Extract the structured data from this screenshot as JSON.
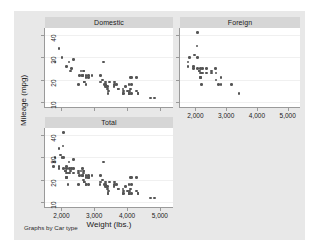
{
  "figure": {
    "note": "Graphs by Car type",
    "xlabel": "Weight (lbs.)",
    "ylabel": "Mileage (mpg)",
    "background": "#e8e8e8",
    "panel_header_color": "#d6d6d6",
    "marker_color": "#555555"
  },
  "chart_data": {
    "type": "scatter",
    "title": "",
    "subtitle": "",
    "xlabel": "Weight (lbs.)",
    "ylabel": "Mileage (mpg)",
    "xlim": [
      1500,
      5400
    ],
    "ylim": [
      8,
      43
    ],
    "xticks": [
      2000,
      3000,
      4000,
      5000
    ],
    "xtick_labels": [
      "2,000",
      "3,000",
      "4,000",
      "5,000"
    ],
    "yticks": [
      10,
      20,
      30,
      40
    ],
    "ytick_labels": [
      "10",
      "20",
      "30",
      "40"
    ],
    "grid": "horizontal",
    "legend": "none",
    "note": "Graphs by Car type",
    "panels": [
      {
        "label": "Domestic",
        "position": "top-left",
        "show_xticks": false,
        "points": [
          [
            2930,
            22
          ],
          [
            3350,
            17
          ],
          [
            2640,
            22
          ],
          [
            3250,
            20
          ],
          [
            4080,
            15
          ],
          [
            3670,
            18
          ],
          [
            3880,
            14
          ],
          [
            3400,
            16
          ],
          [
            4330,
            14
          ],
          [
            3900,
            14
          ],
          [
            4290,
            21
          ],
          [
            4100,
            21
          ],
          [
            3360,
            18
          ],
          [
            2160,
            26
          ],
          [
            2670,
            24
          ],
          [
            2595,
            24
          ],
          [
            2700,
            19
          ],
          [
            3310,
            18
          ],
          [
            2750,
            21
          ],
          [
            3470,
            19
          ],
          [
            4130,
            18
          ],
          [
            3620,
            19
          ],
          [
            2830,
            21
          ],
          [
            3200,
            22
          ],
          [
            4060,
            18
          ],
          [
            3720,
            16
          ],
          [
            3370,
            17
          ],
          [
            3740,
            16
          ],
          [
            3955,
            17
          ],
          [
            4010,
            15
          ],
          [
            3600,
            17
          ],
          [
            3330,
            18
          ],
          [
            2830,
            22
          ],
          [
            2560,
            22
          ],
          [
            4720,
            12
          ],
          [
            3430,
            15
          ],
          [
            3610,
            18
          ],
          [
            2690,
            24
          ],
          [
            3180,
            19
          ],
          [
            3280,
            28
          ],
          [
            2750,
            18
          ],
          [
            4060,
            14
          ],
          [
            4130,
            14
          ],
          [
            4060,
            14
          ],
          [
            4130,
            21
          ],
          [
            2690,
            19
          ],
          [
            2230,
            28
          ],
          [
            2370,
            29
          ],
          [
            2020,
            30
          ],
          [
            2280,
            24
          ],
          [
            2750,
            22
          ],
          [
            1800,
            28
          ],
          [
            1930,
            34
          ],
          [
            2520,
            18
          ],
          [
            2690,
            19
          ],
          [
            3420,
            14
          ],
          [
            3210,
            19
          ],
          [
            4070,
            14
          ],
          [
            4840,
            12
          ],
          [
            2640,
            22
          ],
          [
            3880,
            16
          ],
          [
            3400,
            17
          ],
          [
            4330,
            14
          ],
          [
            3900,
            15
          ],
          [
            4290,
            15
          ],
          [
            4100,
            16
          ],
          [
            3360,
            17
          ],
          [
            2300,
            25
          ],
          [
            3350,
            19
          ]
        ]
      },
      {
        "label": "Foreign",
        "position": "top-right",
        "show_xticks": true,
        "points": [
          [
            2520,
            23
          ],
          [
            2070,
            25
          ],
          [
            1800,
            30
          ],
          [
            1760,
            28
          ],
          [
            2050,
            35
          ],
          [
            2240,
            25
          ],
          [
            2520,
            24
          ],
          [
            2160,
            21
          ],
          [
            2370,
            25
          ],
          [
            2200,
            18
          ],
          [
            2670,
            20
          ],
          [
            2130,
            24
          ],
          [
            2650,
            25
          ],
          [
            2750,
            18
          ],
          [
            2160,
            21
          ],
          [
            1980,
            31
          ],
          [
            2830,
            18
          ],
          [
            2070,
            41
          ],
          [
            1930,
            25
          ],
          [
            2160,
            25
          ],
          [
            2370,
            23
          ],
          [
            3170,
            18
          ],
          [
            3420,
            14
          ],
          [
            2830,
            21
          ],
          [
            2200,
            23
          ],
          [
            2670,
            23
          ],
          [
            1760,
            26
          ],
          [
            1930,
            26
          ],
          [
            2070,
            30
          ],
          [
            2120,
            24
          ],
          [
            2160,
            23
          ],
          [
            2240,
            23
          ]
        ]
      },
      {
        "label": "Total",
        "position": "bottom-left",
        "show_xticks": true,
        "points": [
          [
            2930,
            22
          ],
          [
            3350,
            17
          ],
          [
            2640,
            22
          ],
          [
            3250,
            20
          ],
          [
            4080,
            15
          ],
          [
            3670,
            18
          ],
          [
            3880,
            14
          ],
          [
            3400,
            16
          ],
          [
            4330,
            14
          ],
          [
            3900,
            14
          ],
          [
            4290,
            21
          ],
          [
            4100,
            21
          ],
          [
            3360,
            18
          ],
          [
            2160,
            26
          ],
          [
            2670,
            24
          ],
          [
            2595,
            24
          ],
          [
            2700,
            19
          ],
          [
            3310,
            18
          ],
          [
            2750,
            21
          ],
          [
            3470,
            19
          ],
          [
            4130,
            18
          ],
          [
            3620,
            19
          ],
          [
            2830,
            21
          ],
          [
            3200,
            22
          ],
          [
            4060,
            18
          ],
          [
            3720,
            16
          ],
          [
            3370,
            17
          ],
          [
            3740,
            16
          ],
          [
            3955,
            17
          ],
          [
            4010,
            15
          ],
          [
            3600,
            17
          ],
          [
            3330,
            18
          ],
          [
            2830,
            22
          ],
          [
            2560,
            22
          ],
          [
            4720,
            12
          ],
          [
            3430,
            15
          ],
          [
            3610,
            18
          ],
          [
            2690,
            24
          ],
          [
            3180,
            19
          ],
          [
            3280,
            28
          ],
          [
            2750,
            18
          ],
          [
            4060,
            14
          ],
          [
            4130,
            14
          ],
          [
            4060,
            14
          ],
          [
            4130,
            21
          ],
          [
            2690,
            19
          ],
          [
            2230,
            28
          ],
          [
            2370,
            29
          ],
          [
            2020,
            30
          ],
          [
            2280,
            24
          ],
          [
            2750,
            22
          ],
          [
            1800,
            28
          ],
          [
            1930,
            34
          ],
          [
            2520,
            18
          ],
          [
            2690,
            19
          ],
          [
            3420,
            14
          ],
          [
            3210,
            19
          ],
          [
            4070,
            14
          ],
          [
            4840,
            12
          ],
          [
            2640,
            22
          ],
          [
            3880,
            16
          ],
          [
            3400,
            17
          ],
          [
            4330,
            14
          ],
          [
            3900,
            15
          ],
          [
            4290,
            15
          ],
          [
            4100,
            16
          ],
          [
            3360,
            17
          ],
          [
            2300,
            25
          ],
          [
            3350,
            19
          ],
          [
            2520,
            23
          ],
          [
            2070,
            25
          ],
          [
            1800,
            30
          ],
          [
            1760,
            28
          ],
          [
            2050,
            35
          ],
          [
            2240,
            25
          ],
          [
            2520,
            24
          ],
          [
            2160,
            21
          ],
          [
            2370,
            25
          ],
          [
            2200,
            18
          ],
          [
            2670,
            20
          ],
          [
            2130,
            24
          ],
          [
            2650,
            25
          ],
          [
            2750,
            18
          ],
          [
            2160,
            21
          ],
          [
            1980,
            31
          ],
          [
            2830,
            18
          ],
          [
            2070,
            41
          ],
          [
            1930,
            25
          ],
          [
            2160,
            25
          ],
          [
            2370,
            23
          ],
          [
            3170,
            18
          ],
          [
            3420,
            14
          ],
          [
            2830,
            21
          ],
          [
            2200,
            23
          ],
          [
            2670,
            23
          ],
          [
            1760,
            26
          ],
          [
            1930,
            26
          ],
          [
            2070,
            30
          ],
          [
            2120,
            24
          ],
          [
            2160,
            23
          ],
          [
            2240,
            23
          ]
        ]
      }
    ]
  }
}
